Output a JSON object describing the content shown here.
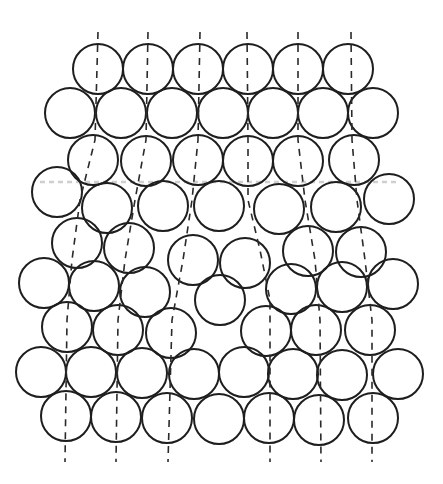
{
  "diagram": {
    "title": "",
    "colors": {
      "stroke": "#1e1e1e",
      "background": "#ffffff",
      "plane": "#cfcfcf"
    },
    "radius": 25,
    "atoms": [
      [
        98,
        69
      ],
      [
        148,
        69
      ],
      [
        198,
        69
      ],
      [
        248,
        69
      ],
      [
        298,
        69
      ],
      [
        348,
        69
      ],
      [
        70,
        113
      ],
      [
        121,
        113
      ],
      [
        172,
        113
      ],
      [
        223,
        113
      ],
      [
        273,
        113
      ],
      [
        323,
        113
      ],
      [
        373,
        113
      ],
      [
        93,
        160
      ],
      [
        146,
        161
      ],
      [
        198,
        160
      ],
      [
        248,
        161
      ],
      [
        298,
        161
      ],
      [
        354,
        160
      ],
      [
        57,
        192
      ],
      [
        107,
        208
      ],
      [
        163,
        206
      ],
      [
        219,
        206
      ],
      [
        279,
        209
      ],
      [
        336,
        207
      ],
      [
        389,
        199
      ],
      [
        77,
        243
      ],
      [
        129,
        248
      ],
      [
        193,
        260
      ],
      [
        245,
        263
      ],
      [
        308,
        251
      ],
      [
        361,
        252
      ],
      [
        44,
        283
      ],
      [
        94,
        286
      ],
      [
        145,
        292
      ],
      [
        220,
        300
      ],
      [
        291,
        289
      ],
      [
        342,
        287
      ],
      [
        393,
        284
      ],
      [
        67,
        327
      ],
      [
        118,
        330
      ],
      [
        171,
        333
      ],
      [
        266,
        331
      ],
      [
        316,
        330
      ],
      [
        370,
        330
      ],
      [
        41,
        372
      ],
      [
        91,
        372
      ],
      [
        142,
        373
      ],
      [
        194,
        374
      ],
      [
        244,
        372
      ],
      [
        293,
        374
      ],
      [
        342,
        375
      ],
      [
        398,
        374
      ],
      [
        66,
        416
      ],
      [
        116,
        417
      ],
      [
        167,
        418
      ],
      [
        219,
        419
      ],
      [
        269,
        418
      ],
      [
        319,
        420
      ],
      [
        373,
        418
      ]
    ],
    "slip_lines": [
      "M98,32 L95,140 L80,200 L72,260 L67,320 L65,462",
      "M148,32 L146,140 L135,200 L125,260 L118,320 L116,462",
      "M200,32 L198,140 L192,200 L183,260 L172,320 L168,462",
      "M247,32 L248,140 L248,200 L260,250 L270,300 L270,462",
      "M298,32 L298,140 L305,200 L315,260 L320,320 L321,462",
      "M351,32 L352,140 L357,200 L365,260 L372,320 L372,462"
    ],
    "plane_line": "M40,182 L400,182"
  }
}
